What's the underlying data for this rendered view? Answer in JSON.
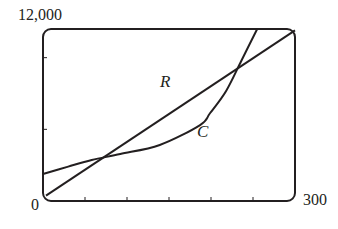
{
  "chart_data": {
    "type": "line",
    "title": "",
    "xlabel": "",
    "ylabel": "",
    "xlim": [
      0,
      300
    ],
    "ylim": [
      0,
      12000
    ],
    "x_tick_spacing": 50,
    "y_tick_spacing": 5000,
    "x_tick_labels": {
      "min": "0",
      "max": "300"
    },
    "y_tick_labels": {
      "max": "12,000"
    },
    "grid": false,
    "legend": "none",
    "annotations": [
      {
        "text": "R",
        "near_series": "R"
      },
      {
        "text": "C",
        "near_series": "C"
      }
    ],
    "series": [
      {
        "name": "R",
        "x": [
          0,
          58,
          150,
          236,
          300
        ],
        "y": [
          300,
          2860,
          6390,
          9770,
          11900
        ]
      },
      {
        "name": "C",
        "x": [
          0,
          30,
          58,
          92,
          139,
          187,
          199,
          218,
          236,
          255
        ],
        "y": [
          1880,
          2400,
          2860,
          3280,
          3910,
          5300,
          6140,
          7680,
          9770,
          12000
        ]
      }
    ]
  },
  "labels": {
    "y_max": "12,000",
    "x_min": "0",
    "x_max": "300",
    "curve_R": "R",
    "curve_C": "C"
  },
  "colors": {
    "ink": "#231f20",
    "background": "#ffffff"
  }
}
